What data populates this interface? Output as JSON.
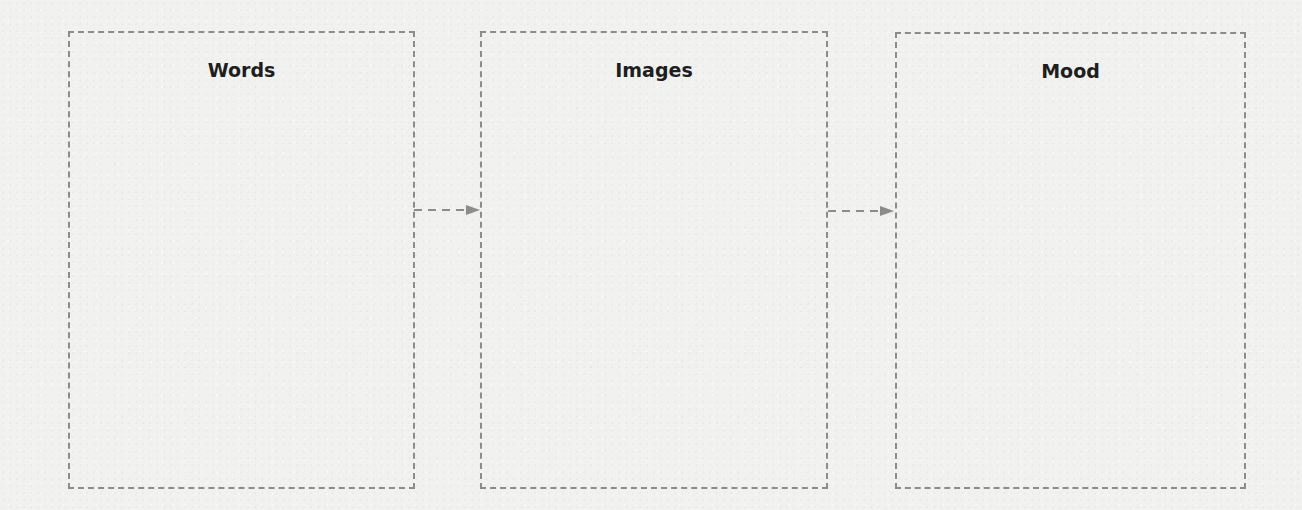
{
  "diagram": {
    "boxes": [
      {
        "id": "words",
        "label": "Words"
      },
      {
        "id": "images",
        "label": "Images"
      },
      {
        "id": "mood",
        "label": "Mood"
      }
    ],
    "connectors": [
      {
        "from": "words",
        "to": "images",
        "style": "dashed-arrow"
      },
      {
        "from": "images",
        "to": "mood",
        "style": "dashed-arrow"
      }
    ],
    "colors": {
      "stroke": "#8c8c8c",
      "text": "#1e1e1e",
      "background": "#f1f1ef"
    }
  }
}
